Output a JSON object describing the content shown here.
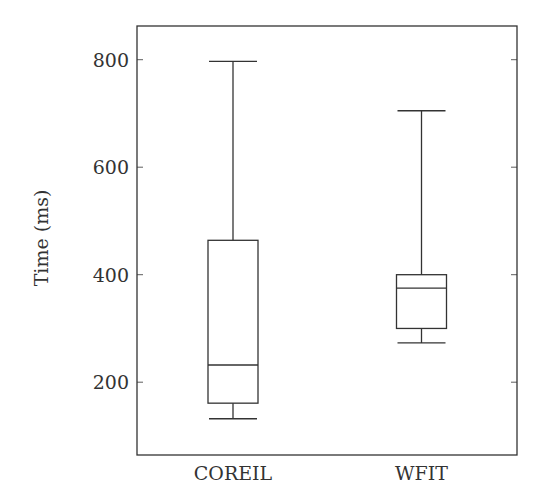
{
  "chart_data": {
    "type": "boxplot",
    "title": "",
    "xlabel": "",
    "ylabel": "Time (ms)",
    "categories": [
      "COREIL",
      "WFIT"
    ],
    "yticks": [
      200,
      400,
      600,
      800
    ],
    "ylim": [
      60,
      870
    ],
    "grid": false,
    "legend": null,
    "series": [
      {
        "name": "COREIL",
        "lower_whisker": 132,
        "q1": 161,
        "median": 232,
        "q3": 464,
        "upper_whisker": 797
      },
      {
        "name": "WFIT",
        "lower_whisker": 273,
        "q1": 300,
        "median": 375,
        "q3": 400,
        "upper_whisker": 705
      }
    ],
    "colors": {
      "stroke": "#333333",
      "frame": "#333333",
      "background": "#ffffff"
    }
  }
}
